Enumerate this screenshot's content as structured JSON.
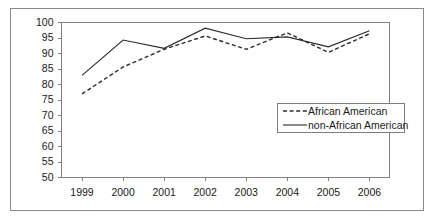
{
  "chart_data": {
    "type": "line",
    "title": "",
    "xlabel": "",
    "ylabel": "",
    "categories": [
      "1999",
      "2000",
      "2001",
      "2002",
      "2003",
      "2004",
      "2005",
      "2006"
    ],
    "ylim": [
      50,
      100
    ],
    "yticks": [
      50,
      55,
      60,
      65,
      70,
      75,
      80,
      85,
      90,
      95,
      100
    ],
    "ytick_labels": [
      "50",
      "55",
      "60",
      "65",
      "70",
      "75",
      "80",
      "85",
      "90",
      "95",
      "100"
    ],
    "grid": false,
    "legend_position": "center-right",
    "series": [
      {
        "name": "African American",
        "style": "dashed",
        "color": "#2b2b2b",
        "values": [
          76.8,
          85.5,
          91.2,
          95.5,
          91.2,
          96.5,
          90.2,
          96.2
        ]
      },
      {
        "name": "non-African American",
        "style": "solid",
        "color": "#2b2b2b",
        "values": [
          82.8,
          94.2,
          91.5,
          98.0,
          94.6,
          95.2,
          92.0,
          97.2
        ]
      }
    ]
  },
  "legend": {
    "entries": [
      {
        "label": "African American",
        "style": "dashed"
      },
      {
        "label": "non-African American",
        "style": "solid"
      }
    ]
  }
}
